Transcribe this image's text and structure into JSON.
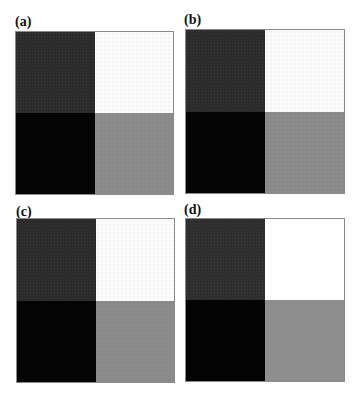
{
  "figure": {
    "panels": [
      {
        "label": "(a)",
        "quadrants": {
          "top_left": "#2b2b2b",
          "top_right": "#fbfbfb",
          "bottom_left": "#050505",
          "bottom_right": "#8c8c8c"
        }
      },
      {
        "label": "(b)",
        "quadrants": {
          "top_left": "#2b2b2b",
          "top_right": "#fbfbfb",
          "bottom_left": "#050505",
          "bottom_right": "#8c8c8c"
        }
      },
      {
        "label": "(c)",
        "quadrants": {
          "top_left": "#2b2b2b",
          "top_right": "#fbfbfb",
          "bottom_left": "#050505",
          "bottom_right": "#8c8c8c"
        }
      },
      {
        "label": "(d)",
        "quadrants": {
          "top_left": "#2e2e2e",
          "top_right": "#ffffff",
          "bottom_left": "#030303",
          "bottom_right": "#8e8e8e"
        }
      }
    ]
  }
}
